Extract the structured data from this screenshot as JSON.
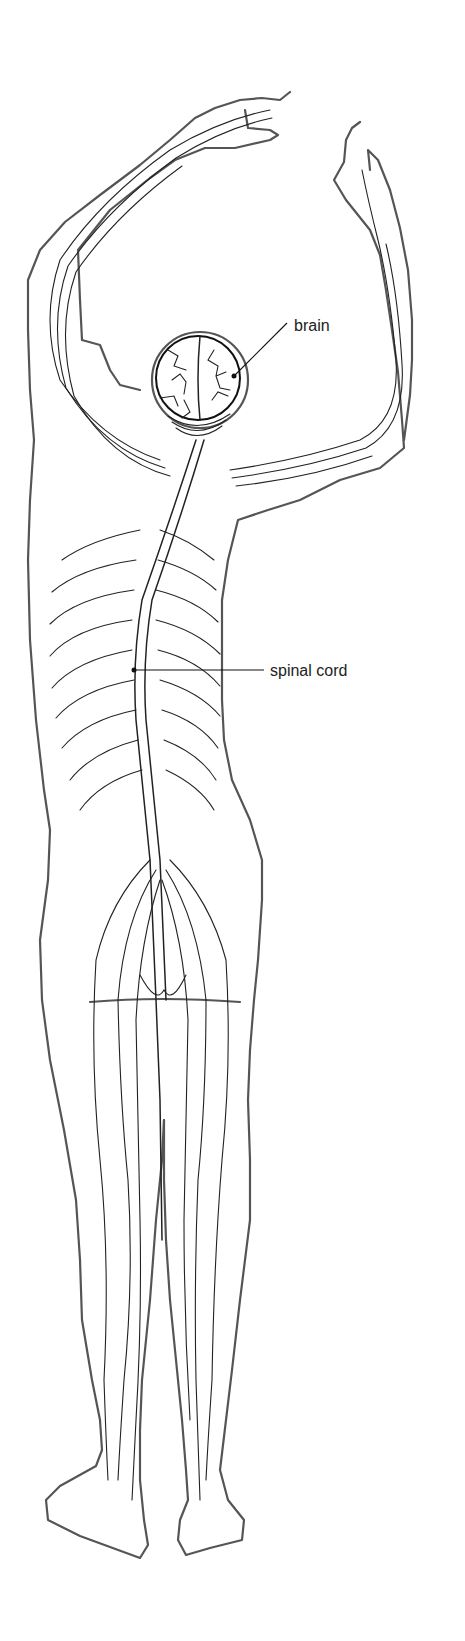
{
  "diagram": {
    "labels": {
      "brain": "brain",
      "spinal_cord": "spinal cord"
    },
    "colors": {
      "background": "#ffffff",
      "line": "#222222",
      "outline": "#555555"
    }
  }
}
